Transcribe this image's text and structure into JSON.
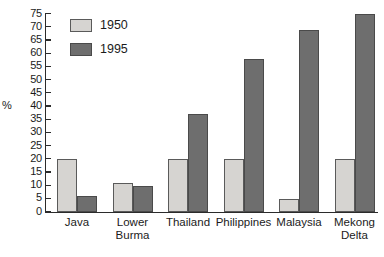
{
  "chart_data": {
    "type": "bar",
    "title": "",
    "xlabel": "",
    "ylabel": "%",
    "ylim": [
      0,
      75
    ],
    "yticks": [
      0,
      5,
      10,
      15,
      20,
      25,
      30,
      35,
      40,
      45,
      50,
      55,
      60,
      65,
      70,
      75
    ],
    "grid": false,
    "legend_position": "top-left",
    "categories": [
      "Java",
      "Lower\nBurma",
      "Thailand",
      "Philippines",
      "Malaysia",
      "Mekong\nDelta"
    ],
    "series": [
      {
        "name": "1950",
        "color": "#d6d4d1",
        "values": [
          20,
          11,
          20,
          20,
          5,
          20
        ]
      },
      {
        "name": "1995",
        "color": "#6e6e6e",
        "values": [
          6,
          10,
          37,
          58,
          69,
          75
        ]
      }
    ]
  },
  "axis": {
    "unit_label": "%"
  },
  "legend": {
    "items": [
      {
        "label": "1950"
      },
      {
        "label": "1995"
      }
    ]
  },
  "caption": {
    "text": ""
  }
}
